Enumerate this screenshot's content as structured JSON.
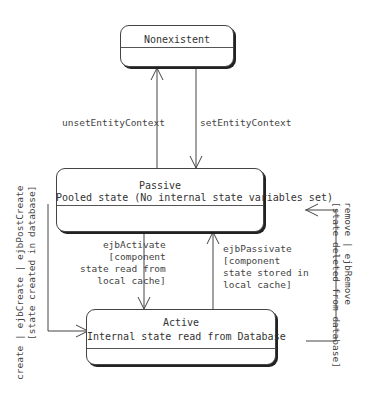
{
  "states": {
    "nonexistent": {
      "title": "Nonexistent"
    },
    "passive": {
      "title": "Passive",
      "description": "Pooled state (No internal state variables set)"
    },
    "active": {
      "title": "Active",
      "description": "Internal state read from Database"
    }
  },
  "transitions": {
    "unset_entity_context": {
      "label": "unsetEntityContext"
    },
    "set_entity_context": {
      "label": "setEntityContext"
    },
    "ejb_activate": {
      "label": "ejbActivate\n   [component\nstate read from\n  local cache]"
    },
    "ejb_passivate": {
      "label": "ejbPassivate\n[component\nstate stored in\nlocal cache]"
    },
    "create": {
      "label": "create | ejbCreate | ejbPostCreate\n       [state created in database]"
    },
    "remove": {
      "label": "remove | ejbRemove\n[state deleted from database]"
    }
  }
}
